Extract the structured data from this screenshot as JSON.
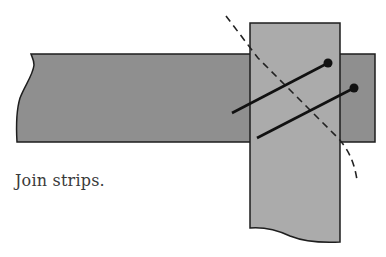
{
  "diagram": {
    "caption": "Join strips.",
    "colors": {
      "horizontal_strip": "#8f8f8f",
      "vertical_strip": "#ababab",
      "outline": "#1e1e1e",
      "stitch": "#111111",
      "fold_line": "#222222",
      "background": "#ffffff"
    },
    "elements": [
      {
        "name": "horizontal-strip",
        "description": "darker fabric strip running left to right"
      },
      {
        "name": "vertical-strip",
        "description": "lighter fabric strip placed perpendicular on top"
      },
      {
        "name": "diagonal-fold-line",
        "description": "dashed diagonal seam guide line"
      },
      {
        "name": "pin-1",
        "description": "upper straight pin across the overlap"
      },
      {
        "name": "pin-2",
        "description": "lower straight pin across the overlap"
      }
    ]
  }
}
